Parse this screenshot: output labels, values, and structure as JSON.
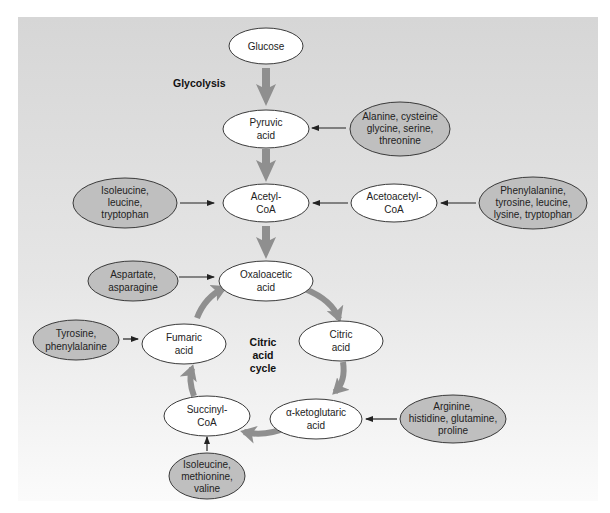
{
  "diagram": {
    "type": "metabolic-pathway",
    "background": {
      "top_color": "#d6d6d6",
      "bottom_color": "#fbfbfb"
    },
    "colors": {
      "metabolite_fill": "#ffffff",
      "amino_acid_fill": "#bfbfbf",
      "outline": "#3a3a3a",
      "thick_arrow": "#8f8f8f",
      "thin_arrow": "#222222"
    },
    "labels": {
      "glycolysis": "Glycolysis",
      "cycle_line1": "Citric",
      "cycle_line2": "acid",
      "cycle_line3": "cycle"
    },
    "metabolites": {
      "glucose": [
        "Glucose"
      ],
      "pyruvic_acid": [
        "Pyruvic",
        "acid"
      ],
      "acetyl_coa": [
        "Acetyl-",
        "CoA"
      ],
      "acetoacetyl_coa": [
        "Acetoacetyl-",
        "CoA"
      ],
      "oxaloacetic_acid": [
        "Oxaloacetic",
        "acid"
      ],
      "citric_acid": [
        "Citric",
        "acid"
      ],
      "fumaric_acid": [
        "Fumaric",
        "acid"
      ],
      "alpha_ketoglutaric_acid": [
        "α-ketoglutaric",
        "acid"
      ],
      "succinyl_coa": [
        "Succinyl-",
        "CoA"
      ]
    },
    "amino_acids": {
      "to_pyruvic": [
        "Alanine, cysteine",
        "glycine, serine,",
        "threonine"
      ],
      "to_acetyl": [
        "Isoleucine,",
        "leucine,",
        "tryptophan"
      ],
      "to_acetoacetyl": [
        "Phenylalanine,",
        "tyrosine, leucine,",
        "lysine, tryptophan"
      ],
      "to_oxaloacetic": [
        "Aspartate,",
        "asparagine"
      ],
      "to_fumaric": [
        "Tyrosine,",
        "phenylalanine"
      ],
      "to_ketoglutaric": [
        "Arginine,",
        "histidine, glutamine,",
        "proline"
      ],
      "to_succinyl": [
        "Isoleucine,",
        "methionine,",
        "valine"
      ]
    }
  }
}
